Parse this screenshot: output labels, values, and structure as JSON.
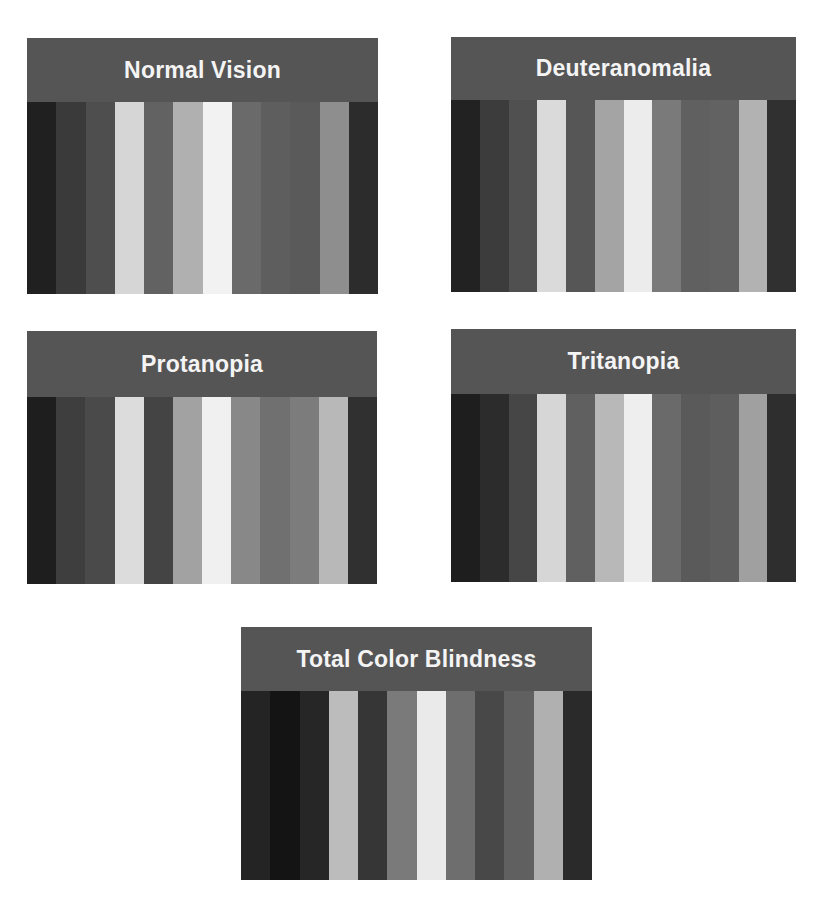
{
  "panels": [
    {
      "id": "normal",
      "title": "Normal Vision",
      "stripes": [
        "#202020",
        "#3a3a3a",
        "#4e4e4e",
        "#d6d6d6",
        "#626262",
        "#b0b0b0",
        "#f2f2f2",
        "#6a6a6a",
        "#5e5e5e",
        "#5a5a5a",
        "#8e8e8e",
        "#2c2c2c"
      ]
    },
    {
      "id": "deuter",
      "title": "Deuteranomalia",
      "stripes": [
        "#222222",
        "#3c3c3c",
        "#505050",
        "#dadada",
        "#565656",
        "#a4a4a4",
        "#ececec",
        "#7a7a7a",
        "#606060",
        "#626262",
        "#b2b2b2",
        "#303030"
      ]
    },
    {
      "id": "protan",
      "title": "Protanopia",
      "stripes": [
        "#1e1e1e",
        "#3e3e3e",
        "#4a4a4a",
        "#dcdcdc",
        "#444444",
        "#a2a2a2",
        "#f0f0f0",
        "#888888",
        "#707070",
        "#7c7c7c",
        "#b8b8b8",
        "#303030"
      ]
    },
    {
      "id": "tritan",
      "title": "Tritanopia",
      "stripes": [
        "#1e1e1e",
        "#2c2c2c",
        "#464646",
        "#d6d6d6",
        "#606060",
        "#b8b8b8",
        "#eeeeee",
        "#6a6a6a",
        "#5a5a5a",
        "#5e5e5e",
        "#a0a0a0",
        "#2e2e2e"
      ]
    },
    {
      "id": "total",
      "title": "Total Color Blindness",
      "stripes": [
        "#242424",
        "#141414",
        "#262626",
        "#bcbcbc",
        "#363636",
        "#7a7a7a",
        "#eaeaea",
        "#6e6e6e",
        "#484848",
        "#606060",
        "#b0b0b0",
        "#2a2a2a"
      ]
    }
  ],
  "colors": {
    "header_bg": "#555555",
    "header_text": "#f4f4f4",
    "page_bg": "#ffffff"
  }
}
